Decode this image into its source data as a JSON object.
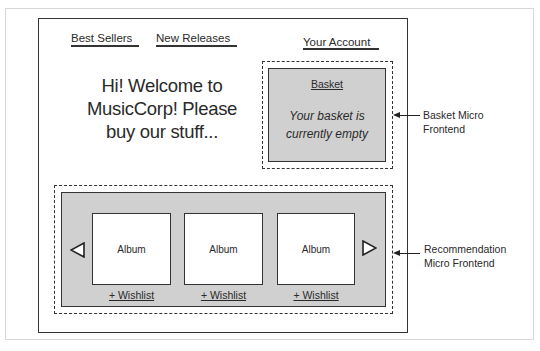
{
  "nav": {
    "links": [
      {
        "label": "Best Sellers"
      },
      {
        "label": "New Releases"
      },
      {
        "label": "Your Account"
      }
    ]
  },
  "welcome": {
    "lines": [
      "Hi! Welcome to",
      "MusicCorp! Please",
      "buy our stuff..."
    ]
  },
  "basket": {
    "title": "Basket",
    "message_lines": [
      "Your basket is",
      "currently empty"
    ],
    "callout_lines": [
      "Basket Micro",
      "Frontend"
    ]
  },
  "recommendation": {
    "albums": [
      {
        "label": "Album",
        "wishlist": "+ Wishlist"
      },
      {
        "label": "Album",
        "wishlist": "+ Wishlist"
      },
      {
        "label": "Album",
        "wishlist": "+ Wishlist"
      }
    ],
    "prev_icon": "triangle-left-icon",
    "next_icon": "triangle-right-icon",
    "callout_lines": [
      "Recommendation",
      "Micro Frontend"
    ]
  },
  "colors": {
    "frame": "#333333",
    "panel_gray": "#d0d0d0",
    "outer_border": "#d8d8d8"
  }
}
